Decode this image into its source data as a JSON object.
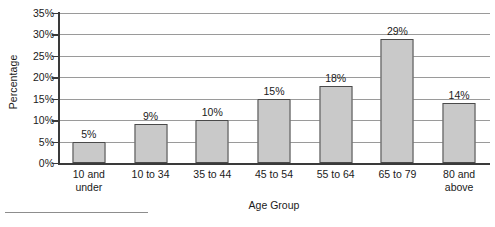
{
  "chart_data": {
    "type": "bar",
    "title": "",
    "xlabel": "Age Group",
    "ylabel": "Percentage",
    "categories": [
      "10 and under",
      "10 to 34",
      "35 to 44",
      "45 to 54",
      "55 to 64",
      "65 to 79",
      "80 and above"
    ],
    "category_lines": [
      [
        "10 and",
        "under"
      ],
      [
        "10 to 34",
        ""
      ],
      [
        "35 to 44",
        ""
      ],
      [
        "45 to 54",
        ""
      ],
      [
        "55 to 64",
        ""
      ],
      [
        "65 to 79",
        ""
      ],
      [
        "80 and",
        "above"
      ]
    ],
    "values": [
      5,
      9,
      10,
      15,
      18,
      29,
      14
    ],
    "data_labels": [
      "5%",
      "9%",
      "10%",
      "15%",
      "18%",
      "29%",
      "14%"
    ],
    "ylim": [
      0,
      35
    ],
    "ytick_values": [
      0,
      5,
      10,
      15,
      20,
      25,
      30,
      35
    ],
    "ytick_labels": [
      "0%",
      "5%",
      "10%",
      "15%",
      "20%",
      "25%",
      "30%",
      "35%"
    ],
    "grid": true,
    "legend": false,
    "bar_color": "#c9c9c9",
    "bar_border_color": "#4a4a4a",
    "gridline_color": "#9a9a9a",
    "axis_color": "#3a3a3a"
  }
}
